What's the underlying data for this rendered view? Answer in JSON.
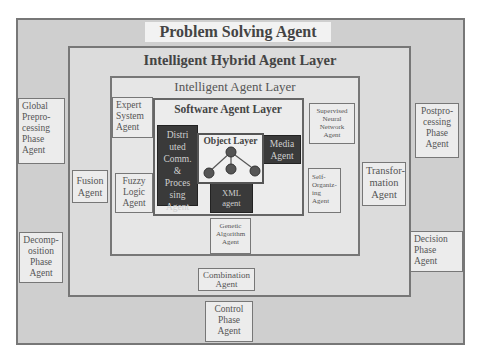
{
  "layers": {
    "problem_solving": "Problem Solving Agent Layer",
    "intelligent_hybrid": "Intelligent Hybrid Agent Layer",
    "intelligent": "Intelligent Agent Layer",
    "software": "Software Agent Layer",
    "object": "Object Layer"
  },
  "agents": {
    "global_preprocessing": "Global Prepro- cessing Phase Agent",
    "decomposition": "Decomp- osition Phase Agent",
    "postprocessing": "Postpro- cessing Phase Agent",
    "decision": "Decision Phase Agent",
    "control": "Control Phase Agent",
    "fusion": "Fusion Agent",
    "transformation": "Transfor- mation Agent",
    "combination": "Combination Agent",
    "expert_system": "Expert System Agent",
    "fuzzy_logic": "Fuzzy Logic Agent",
    "supervised_nn": "Supervised Neural Network Agent",
    "self_organizing": "Self- Organiz- ing Agent",
    "genetic_algorithm": "Genetic Algorithm Agent",
    "distributed": "Distri uted Comm. & Proces sing Agent",
    "media": "Media Agent",
    "xml": "XML agent"
  },
  "colors": {
    "outer_bg": "#cfcfcf",
    "hybrid_bg": "#dcdcdc",
    "intelligent_bg": "#e6e6e6",
    "dark_box": "#3a3a3a",
    "border": "#777777"
  }
}
